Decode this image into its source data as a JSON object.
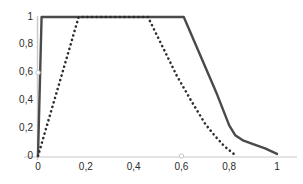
{
  "chart_data": {
    "type": "line",
    "title": "",
    "subtitle": "",
    "xlabel": "",
    "ylabel": "",
    "xlim": [
      0,
      1
    ],
    "ylim": [
      0,
      1
    ],
    "grid": false,
    "legend": "none",
    "x_tick_labels": [
      "0",
      "0,2",
      "0,4",
      "0,6",
      "0,8",
      "1"
    ],
    "x_tick_values": [
      0,
      0.2,
      0.4,
      0.6,
      0.8,
      1
    ],
    "y_tick_labels": [
      "0",
      "0,2",
      "0,4",
      "0,6",
      "0,8",
      "1"
    ],
    "y_tick_values": [
      0,
      0.2,
      0.4,
      0.6,
      0.8,
      1
    ],
    "series": [
      {
        "name": "solid-trapezoid",
        "style": "solid",
        "color": "#4a4a4a",
        "width": 2.4,
        "x": [
          0.0,
          0.015,
          0.1,
          0.2,
          0.3,
          0.4,
          0.5,
          0.61,
          0.66,
          0.7,
          0.75,
          0.8,
          0.825,
          0.86,
          0.9,
          0.95,
          1.0
        ],
        "y": [
          0.0,
          1.0,
          1.0,
          1.0,
          1.0,
          1.0,
          1.0,
          1.0,
          0.8,
          0.64,
          0.44,
          0.22,
          0.15,
          0.11,
          0.085,
          0.055,
          0.015
        ]
      },
      {
        "name": "dotted-trapezoid",
        "style": "dotted",
        "color": "#2e2e2e",
        "width": 2.6,
        "x": [
          0.0,
          0.04,
          0.08,
          0.12,
          0.17,
          0.25,
          0.33,
          0.4,
          0.46,
          0.52,
          0.58,
          0.64,
          0.7,
          0.74,
          0.78,
          0.83
        ],
        "y": [
          0.0,
          0.235,
          0.47,
          0.705,
          1.0,
          1.0,
          1.0,
          1.0,
          1.0,
          0.79,
          0.58,
          0.4,
          0.23,
          0.145,
          0.07,
          0.0
        ]
      }
    ],
    "point_markers": [
      {
        "name": "y-axis-marker",
        "x": 0.0,
        "y": 0.6
      },
      {
        "name": "x-axis-marker",
        "x": 0.6,
        "y": 0.0
      }
    ],
    "axis_color": "#c8c8c8",
    "text_color": "#2b2b2b"
  }
}
